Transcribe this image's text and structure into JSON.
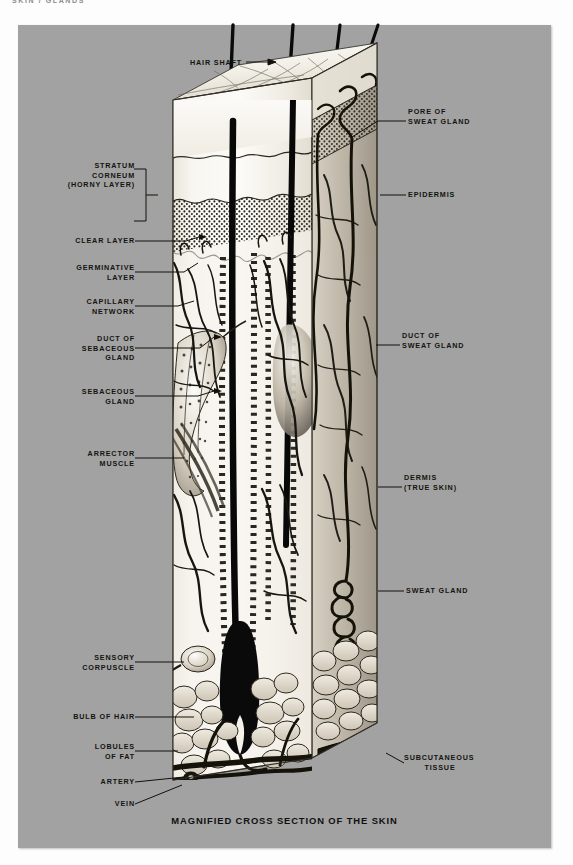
{
  "page": {
    "running_header": "SKIN / GLANDS",
    "background_color": "#fdfdfd",
    "plate_color": "#a2a2a2"
  },
  "figure": {
    "caption": "MAGNIFIED CROSS SECTION OF THE SKIN",
    "top_label": "HAIR SHAFT",
    "top_label_arrow": "→"
  },
  "labels_left": [
    {
      "id": "stratum-corneum",
      "lines": [
        "STRATUM",
        "CORNEUM",
        "(HORNY LAYER)"
      ]
    },
    {
      "id": "clear-layer",
      "lines": [
        "CLEAR LAYER"
      ]
    },
    {
      "id": "germinative-layer",
      "lines": [
        "GERMINATIVE",
        "LAYER"
      ]
    },
    {
      "id": "capillary-network",
      "lines": [
        "CAPILLARY",
        "NETWORK"
      ]
    },
    {
      "id": "duct-of-sebaceous-gland",
      "lines": [
        "DUCT OF",
        "SEBACEOUS",
        "GLAND"
      ]
    },
    {
      "id": "sebaceous-gland",
      "lines": [
        "SEBACEOUS",
        "GLAND"
      ]
    },
    {
      "id": "arrector-muscle",
      "lines": [
        "ARRECTOR",
        "MUSCLE"
      ]
    },
    {
      "id": "sensory-corpuscle",
      "lines": [
        "SENSORY",
        "CORPUSCLE"
      ]
    },
    {
      "id": "bulb-of-hair",
      "lines": [
        "BULB OF HAIR"
      ]
    },
    {
      "id": "lobules-of-fat",
      "lines": [
        "LOBULES",
        "OF FAT"
      ]
    },
    {
      "id": "artery",
      "lines": [
        "ARTERY"
      ]
    },
    {
      "id": "vein",
      "lines": [
        "VEIN"
      ]
    }
  ],
  "labels_right": [
    {
      "id": "pore-of-sweat-gland",
      "lines": [
        "PORE OF",
        "SWEAT GLAND"
      ]
    },
    {
      "id": "epidermis",
      "lines": [
        "EPIDERMIS"
      ]
    },
    {
      "id": "duct-of-sweat-gland",
      "lines": [
        "DUCT OF",
        "SWEAT GLAND"
      ]
    },
    {
      "id": "dermis",
      "lines": [
        "DERMIS",
        "(TRUE SKIN)"
      ]
    },
    {
      "id": "sweat-gland",
      "lines": [
        "SWEAT GLAND"
      ]
    },
    {
      "id": "subcutaneous-tissue",
      "lines": [
        "SUBCUTANEOUS",
        "TISSUE"
      ]
    }
  ]
}
